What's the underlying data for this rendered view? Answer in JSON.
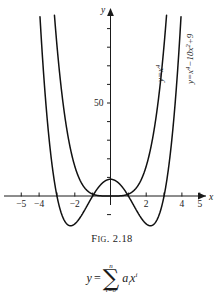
{
  "figure": {
    "caption_prefix": "F",
    "caption_small": "IG",
    "caption_rest": ". 2.18"
  },
  "axes": {
    "x_name": "x",
    "y_name": "y",
    "x_ticks": [
      {
        "value": -5,
        "label": "−5"
      },
      {
        "value": -4,
        "label": "−4"
      },
      {
        "value": -3,
        "label": ""
      },
      {
        "value": -2,
        "label": "−2"
      },
      {
        "value": -1,
        "label": ""
      },
      {
        "value": 1,
        "label": ""
      },
      {
        "value": 2,
        "label": "2"
      },
      {
        "value": 3,
        "label": ""
      },
      {
        "value": 4,
        "label": "4"
      },
      {
        "value": 5,
        "label": "5"
      }
    ],
    "y_ticks": [
      {
        "value": 10,
        "label": ""
      },
      {
        "value": 20,
        "label": ""
      },
      {
        "value": 30,
        "label": ""
      },
      {
        "value": 40,
        "label": ""
      },
      {
        "value": 50,
        "label": "50"
      },
      {
        "value": 60,
        "label": ""
      },
      {
        "value": 70,
        "label": ""
      },
      {
        "value": 80,
        "label": ""
      },
      {
        "value": 90,
        "label": ""
      },
      {
        "value": -10,
        "label": ""
      }
    ],
    "xlim": [
      -5.8,
      6.0
    ],
    "ylim": [
      -15,
      105
    ]
  },
  "curve_labels": {
    "curve1_base": "y=x",
    "curve1_pow": "4",
    "curve2_base": "y=x",
    "curve2_pow1": "4",
    "curve2_mid": "−10x",
    "curve2_pow2": "2",
    "curve2_tail": "+9"
  },
  "formula": {
    "lhs": "y",
    "equals": "=",
    "sum_symbol": "∑",
    "sum_upper": "n",
    "sum_lower": "i=0",
    "coefficient": "a",
    "coef_sub": "i",
    "variable": "x",
    "var_pow": "i"
  },
  "chart_data": {
    "type": "line",
    "title": "FIG. 2.18",
    "xlabel": "x",
    "ylabel": "y",
    "xlim": [
      -5.8,
      6.0
    ],
    "ylim": [
      -15,
      105
    ],
    "grid": false,
    "legend": "inline-curve-labels",
    "x_tick_values": [
      -5,
      -4,
      -3,
      -2,
      -1,
      1,
      2,
      3,
      4,
      5
    ],
    "x_tick_labels": [
      "−5",
      "−4",
      "",
      "−2",
      "",
      "",
      "2",
      "",
      "4",
      "5"
    ],
    "y_tick_values": [
      -10,
      10,
      20,
      30,
      40,
      50,
      60,
      70,
      80,
      90
    ],
    "y_tick_labels": [
      "",
      "",
      "",
      "",
      "",
      "50",
      "",
      "",
      "",
      ""
    ],
    "series": [
      {
        "name": "y=x⁴",
        "expression": "y = x^4",
        "roots": [
          0
        ],
        "minima": [
          {
            "x": 0,
            "y": 0
          }
        ],
        "x": [
          -3.2,
          -3.0,
          -2.5,
          -2.0,
          -1.5,
          -1.0,
          -0.5,
          0,
          0.5,
          1.0,
          1.5,
          2.0,
          2.5,
          3.0,
          3.2
        ],
        "values": [
          104.86,
          81,
          39.06,
          16,
          5.06,
          1,
          0.06,
          0,
          0.06,
          1,
          5.06,
          16,
          39.06,
          81,
          104.86
        ]
      },
      {
        "name": "y=x⁴−10x²+9",
        "expression": "y = x^4 - 10x^2 + 9",
        "roots": [
          -3,
          -1,
          1,
          3
        ],
        "minima": [
          {
            "x": -2.236,
            "y": -16
          },
          {
            "x": 2.236,
            "y": -16
          }
        ],
        "maxima": [
          {
            "x": 0,
            "y": 9
          }
        ],
        "x": [
          -3.9,
          -3.5,
          -3.0,
          -2.5,
          -2.236,
          -2.0,
          -1.5,
          -1.0,
          -0.5,
          0,
          0.5,
          1.0,
          1.5,
          2.0,
          2.236,
          2.5,
          3.0,
          3.5,
          3.9
        ],
        "values": [
          99.2,
          33.5,
          0,
          -17.4,
          -16.0,
          -15.0,
          -11.4,
          0,
          6.6,
          9,
          6.6,
          0,
          -11.4,
          -15.0,
          -16.0,
          -17.4,
          0,
          33.5,
          99.2
        ]
      }
    ]
  }
}
